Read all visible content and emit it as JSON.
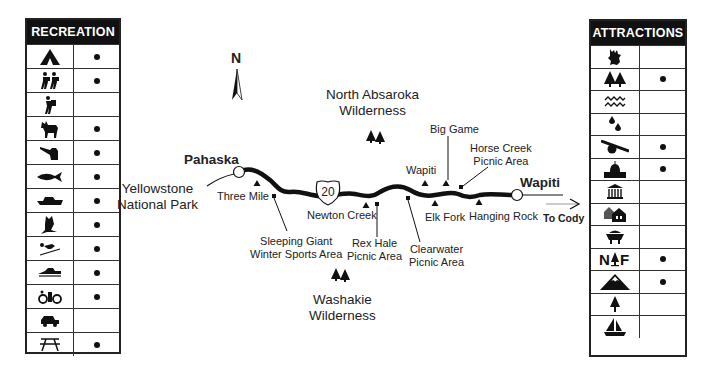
{
  "recreation": {
    "title": "RECREATION",
    "rows": [
      {
        "icon": "tent-camping-icon",
        "available": true
      },
      {
        "icon": "hiking-icon",
        "available": true
      },
      {
        "icon": "backpacking-icon",
        "available": false
      },
      {
        "icon": "horseback-riding-icon",
        "available": true
      },
      {
        "icon": "hunting-icon",
        "available": true
      },
      {
        "icon": "fishing-icon",
        "available": true
      },
      {
        "icon": "boating-icon",
        "available": true
      },
      {
        "icon": "bird-watching-icon",
        "available": true
      },
      {
        "icon": "skiing-icon",
        "available": true
      },
      {
        "icon": "snowmobiling-icon",
        "available": true
      },
      {
        "icon": "bicycling-icon",
        "available": true
      },
      {
        "icon": "off-road-vehicle-icon",
        "available": false
      },
      {
        "icon": "picnic-table-icon",
        "available": true
      }
    ]
  },
  "attractions": {
    "title": "ATTRACTIONS",
    "rows": [
      {
        "icon": "wildlife-elk-icon",
        "available": false
      },
      {
        "icon": "forest-trees-icon",
        "available": true
      },
      {
        "icon": "water-waves-icon",
        "available": false
      },
      {
        "icon": "drops-springs-icon",
        "available": false
      },
      {
        "icon": "cannon-historic-icon",
        "available": true
      },
      {
        "icon": "capitol-building-icon",
        "available": true
      },
      {
        "icon": "museum-icon",
        "available": false
      },
      {
        "icon": "houses-town-icon",
        "available": false
      },
      {
        "icon": "mine-cart-icon",
        "available": false
      },
      {
        "icon": "national-forest-icon",
        "label": "N F",
        "available": true
      },
      {
        "icon": "mountain-icon",
        "available": true
      },
      {
        "icon": "single-tree-icon",
        "available": false
      },
      {
        "icon": "sailboat-icon",
        "available": false
      }
    ]
  },
  "map": {
    "compass": "N",
    "towns": {
      "west": "Pahaska",
      "east": "Wapiti"
    },
    "route_shield": "20",
    "park": {
      "line1": "Yellowstone",
      "line2": "National Park"
    },
    "to_city": "To Cody",
    "wilderness_north": {
      "line1": "North Absaroka",
      "line2": "Wilderness"
    },
    "wilderness_south": {
      "line1": "Washakie",
      "line2": "Wilderness"
    },
    "campgrounds": [
      "Three Mile",
      "Newton Creek",
      "Wapiti",
      "Big Game",
      "Elk Fork",
      "Hanging Rock"
    ],
    "facilities": {
      "sleeping_giant": {
        "line1": "Sleeping Giant",
        "line2": "Winter Sports Area"
      },
      "rex_hale": {
        "line1": "Rex Hale",
        "line2": "Picnic Area"
      },
      "clearwater": {
        "line1": "Clearwater",
        "line2": "Picnic Area"
      },
      "horse_creek": {
        "line1": "Horse Creek",
        "line2": "Picnic Area"
      }
    }
  }
}
